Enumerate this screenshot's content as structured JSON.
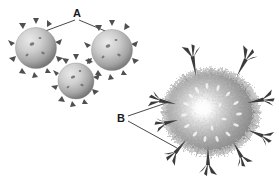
{
  "figure": {
    "title": "",
    "background_color": "#ffffff",
    "width": 279,
    "height": 177,
    "style": "grayscale scientific illustration"
  },
  "labels": [
    {
      "id": "label-a",
      "text": "A",
      "x": 77,
      "y": 17,
      "points_to": "spiked-virus-particles",
      "leader_lines": 2
    },
    {
      "id": "label-b",
      "text": "B",
      "x": 121,
      "y": 122,
      "points_to": "cell-surface-spike-structures",
      "leader_lines": 2
    }
  ],
  "objects": {
    "virus_particles": {
      "name": "spiked-virus-particles",
      "count": 3,
      "fill_light": "#d9d9d9",
      "fill_mid": "#a8a8a8",
      "fill_dark": "#6e6e6e",
      "spike_color": "#4a4a4a",
      "items": [
        {
          "cx": 36,
          "cy": 48,
          "r": 21,
          "spikes": 12
        },
        {
          "cx": 112,
          "cy": 50,
          "r": 21,
          "spikes": 12
        },
        {
          "cx": 76,
          "cy": 81,
          "r": 18,
          "spikes": 11
        }
      ]
    },
    "large_cell": {
      "name": "fuzzy-cell-with-spikes",
      "cx": 211,
      "cy": 112,
      "rx": 48,
      "ry": 44,
      "highlight_color": "#ffffff",
      "mid_color": "#b4b4b4",
      "edge_color": "#787878",
      "spike_color": "#3c3c3c",
      "spike_count": 9,
      "microvilli_color": "#f2f2f2",
      "spikes": [
        {
          "bx": 195,
          "by": 74,
          "angle": -108
        },
        {
          "bx": 238,
          "by": 72,
          "angle": -60
        },
        {
          "bx": 168,
          "by": 104,
          "angle": -172
        },
        {
          "bx": 258,
          "by": 103,
          "angle": -8
        },
        {
          "bx": 262,
          "by": 133,
          "angle": 22
        },
        {
          "bx": 238,
          "by": 150,
          "angle": 62
        },
        {
          "bx": 206,
          "by": 156,
          "angle": 92
        },
        {
          "bx": 176,
          "by": 147,
          "angle": 132
        },
        {
          "bx": 172,
          "by": 120,
          "angle": 168
        }
      ]
    }
  },
  "leader_lines": {
    "color": "#1a1a1a",
    "width": 0.8,
    "a_left": {
      "x1": 75,
      "y1": 20,
      "x2": 40,
      "y2": 33
    },
    "a_right": {
      "x1": 79,
      "y1": 20,
      "x2": 110,
      "y2": 33
    },
    "b_upper": {
      "x1": 128,
      "y1": 116,
      "x2": 169,
      "y2": 102
    },
    "b_lower": {
      "x1": 128,
      "y1": 121,
      "x2": 177,
      "y2": 148
    }
  }
}
